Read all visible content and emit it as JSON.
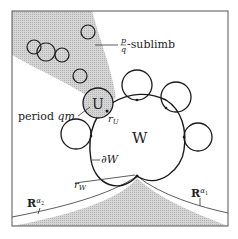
{
  "labels": {
    "sublimb_num": "p",
    "sublimb_den": "q",
    "sublimb_text": "-sublimb",
    "period_text": "period ",
    "period_var": "qm",
    "U": "U",
    "r_U_base": "r",
    "r_U_sub": "U",
    "W": "W",
    "dW": "∂W",
    "r_W_base": "r",
    "r_W_sub": "W",
    "R_alpha2_base": "R",
    "R_alpha2_sup_base": "α",
    "R_alpha2_sup_sub": "2",
    "R_alpha1_base": "R",
    "R_alpha1_sup_base": "α",
    "R_alpha1_sup_sub": "1"
  },
  "colors": {
    "line": "#1a1a1a",
    "shade": "#c8c8c8",
    "frame": "#555555"
  }
}
